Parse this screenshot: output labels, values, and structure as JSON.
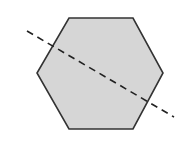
{
  "diagram": {
    "shape": "regular-hexagon",
    "fill_color": "#d6d6d6",
    "stroke_color": "#333333",
    "vertices": [
      [
        69,
        18
      ],
      [
        133,
        18
      ],
      [
        163,
        73
      ],
      [
        133,
        129
      ],
      [
        69,
        129
      ],
      [
        37,
        73
      ]
    ],
    "line": {
      "style": "dashed",
      "color": "#222222",
      "start": [
        27,
        31
      ],
      "end": [
        174,
        117
      ]
    }
  }
}
